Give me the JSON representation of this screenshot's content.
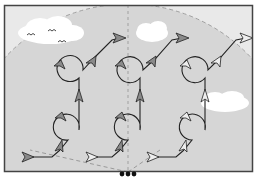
{
  "diagram": {
    "type": "flight-pattern-diagram",
    "colors": {
      "outer_background": "#e9e9e9",
      "dome": "#d6d6d6",
      "frame": "#444444",
      "path": "#222222",
      "arrow_fill": "#8a8a8a",
      "arrow_fill_light": "#eeeeee",
      "cloud": "#ffffff",
      "dashed_line": "#9a9a9a"
    },
    "columns": [
      {
        "name": "left",
        "x": 70
      },
      {
        "name": "center",
        "x": 128
      },
      {
        "name": "right",
        "x": 190
      }
    ],
    "elements": {
      "clouds": 3,
      "birds": 3,
      "loops_per_column": 2,
      "origin_markers": 3
    }
  }
}
